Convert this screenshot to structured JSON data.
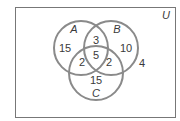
{
  "diagram": {
    "type": "venn-3-set",
    "universe_label": "U",
    "sets": [
      {
        "label": "A",
        "cx": 81,
        "cy": 48,
        "r": 27
      },
      {
        "label": "B",
        "cx": 111,
        "cy": 48,
        "r": 27
      },
      {
        "label": "C",
        "cx": 96,
        "cy": 73,
        "r": 27
      }
    ],
    "regions": {
      "A_only": "15",
      "B_only": "10",
      "C_only": "15",
      "A_and_B_only": "3",
      "A_and_C_only": "2",
      "B_and_C_only": "2",
      "A_and_B_and_C": "5",
      "outside": "4"
    },
    "colors": {
      "stroke": "#8a8a8a",
      "border": "#777777",
      "text": "#3a3a3a",
      "background": "#ffffff"
    }
  }
}
